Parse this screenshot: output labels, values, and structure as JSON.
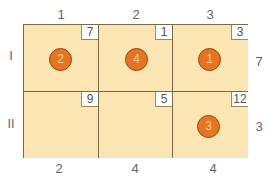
{
  "diagram": {
    "type": "transportation-table",
    "columns": [
      "1",
      "2",
      "3"
    ],
    "rows": [
      "I",
      "II"
    ],
    "supply": [
      "7",
      "3"
    ],
    "demand": [
      "2",
      "4",
      "4"
    ],
    "costs": [
      [
        "7",
        "1",
        "3"
      ],
      [
        "9",
        "5",
        "12"
      ]
    ],
    "allocations": [
      {
        "row": 0,
        "col": 0,
        "value": "2"
      },
      {
        "row": 0,
        "col": 1,
        "value": "4"
      },
      {
        "row": 0,
        "col": 2,
        "value": "1"
      },
      {
        "row": 1,
        "col": 2,
        "value": "3"
      }
    ],
    "colors": {
      "cell_fill": "#fbe5b2",
      "circle_fill": "#e9741f",
      "grid_line": "#7a6a48"
    }
  }
}
